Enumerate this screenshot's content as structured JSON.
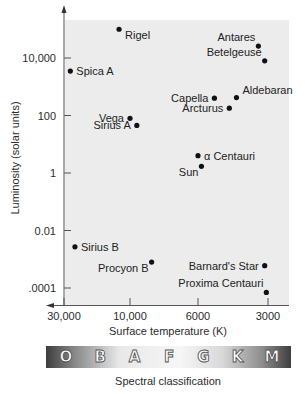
{
  "chart_data": {
    "type": "scatter",
    "title": "",
    "xlabel": "Surface temperature (K)",
    "ylabel": "Luminosity (solar units)",
    "x_scale": "log",
    "x_reversed": true,
    "y_scale": "log",
    "xlim": [
      35000,
      2700
    ],
    "ylim": [
      3e-05,
      300000
    ],
    "grid": false,
    "x_ticks": [
      {
        "value": 30000,
        "label": "30,000"
      },
      {
        "value": 10000,
        "label": "10,000"
      },
      {
        "value": 6000,
        "label": "6000"
      },
      {
        "value": 3000,
        "label": "3000"
      }
    ],
    "y_ticks": [
      {
        "value": 10000,
        "label": "10,000"
      },
      {
        "value": 100,
        "label": "100"
      },
      {
        "value": 1,
        "label": "1"
      },
      {
        "value": 0.01,
        "label": "0.01"
      },
      {
        "value": 0.0001,
        "label": ".0001"
      }
    ],
    "points": [
      {
        "name": "Rigel",
        "temperature": 12000,
        "luminosity": 100000,
        "label_side": "right-below"
      },
      {
        "name": "Spica A",
        "temperature": 27000,
        "luminosity": 3500,
        "label_side": "right"
      },
      {
        "name": "Vega",
        "temperature": 10000,
        "luminosity": 80,
        "label_side": "left"
      },
      {
        "name": "Sirius A",
        "temperature": 9500,
        "luminosity": 45,
        "label_side": "left"
      },
      {
        "name": "Antares",
        "temperature": 3300,
        "luminosity": 26000,
        "label_side": "left-above"
      },
      {
        "name": "Betelgeuse",
        "temperature": 3100,
        "luminosity": 8000,
        "label_side": "left-above"
      },
      {
        "name": "Capella",
        "temperature": 5100,
        "luminosity": 400,
        "label_side": "left"
      },
      {
        "name": "Aldebaran",
        "temperature": 4100,
        "luminosity": 420,
        "label_side": "right-above"
      },
      {
        "name": "Arcturus",
        "temperature": 4400,
        "luminosity": 180,
        "label_side": "left"
      },
      {
        "name": "α Centauri",
        "temperature": 6000,
        "luminosity": 4,
        "label_side": "right"
      },
      {
        "name": "Sun",
        "temperature": 5800,
        "luminosity": 1.7,
        "label_side": "left-below"
      },
      {
        "name": "Sirius B",
        "temperature": 25000,
        "luminosity": 0.0027,
        "label_side": "right"
      },
      {
        "name": "Procyon B",
        "temperature": 8500,
        "luminosity": 0.0008,
        "label_side": "left-below"
      },
      {
        "name": "Barnard's Star",
        "temperature": 3100,
        "luminosity": 0.0006,
        "label_side": "left"
      },
      {
        "name": "Proxima Centauri",
        "temperature": 3050,
        "luminosity": 7e-05,
        "label_side": "left-above"
      }
    ],
    "spectral_bar": {
      "title": "Spectral classification",
      "classes": [
        "O",
        "B",
        "A",
        "F",
        "G",
        "K",
        "M"
      ]
    }
  },
  "colors": {
    "plot_background": "#ececec",
    "axis": "#555555",
    "dot": "#111111",
    "spectral_dark": "#4a4a4a",
    "spectral_light": "#f4f4f4"
  }
}
